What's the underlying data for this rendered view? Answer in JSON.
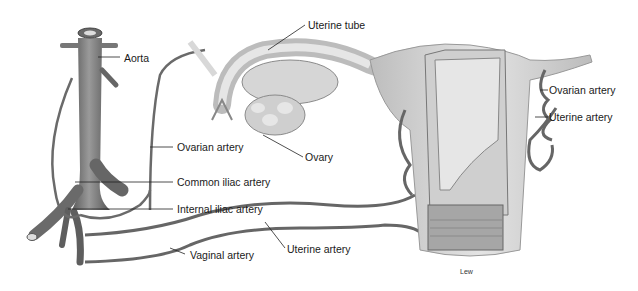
{
  "figure": {
    "labels": {
      "aorta": "Aorta",
      "uterine_tube": "Uterine tube",
      "ovary": "Ovary",
      "ovarian_artery_left": "Ovarian artery",
      "ovarian_artery_right": "Ovarian artery",
      "uterine_artery_right": "Uterine artery",
      "uterine_artery_bottom": "Uterine artery",
      "common_iliac": "Common iliac artery",
      "internal_iliac": "Internal iliac artery",
      "vaginal_artery": "Vaginal artery"
    },
    "credit": "Lew",
    "colors": {
      "vessel": "#6b6b6b",
      "vessel_dark": "#4a4a4a",
      "tissue": "#c9c9c9",
      "tissue_light": "#e2e2e2",
      "leader": "#222222"
    }
  }
}
